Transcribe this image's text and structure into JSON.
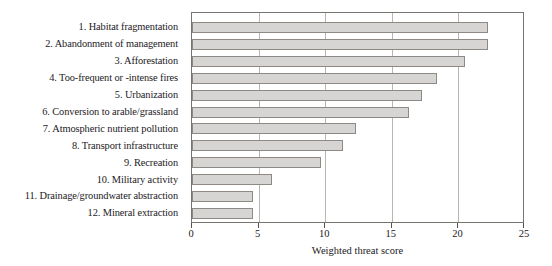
{
  "chart_data": {
    "type": "bar",
    "orientation": "horizontal",
    "title": "",
    "xlabel": "Weighted threat score",
    "ylabel": "",
    "xlim": [
      0,
      25
    ],
    "xticks": [
      0,
      5,
      10,
      15,
      20,
      25
    ],
    "grid": "vertical",
    "legend": "none",
    "bar_fill_color": "#d6d5d3",
    "bar_border_color": "#8d8a86",
    "axis_color": "#77736e",
    "categories": [
      "1. Habitat fragmentation",
      "2. Abandonment of management",
      "3. Afforestation",
      "4. Too-frequent or -intense fires",
      "5. Urbanization",
      "6. Conversion to arable/grassland",
      "7. Atmospheric nutrient pollution",
      "8. Transport infrastructure",
      "9. Recreation",
      "10. Military activity",
      "11. Drainage/groundwater abstraction",
      "12. Mineral extraction"
    ],
    "values": [
      22.2,
      22.2,
      20.5,
      18.4,
      17.3,
      16.3,
      12.3,
      11.3,
      9.7,
      6.0,
      4.6,
      4.6
    ]
  }
}
